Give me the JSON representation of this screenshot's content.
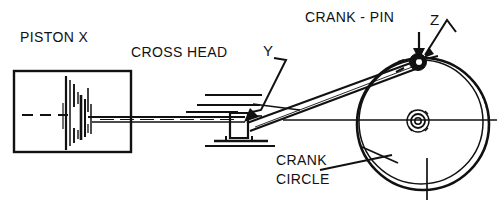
{
  "diagram": {
    "type": "mechanical-line-drawing",
    "stroke_color": "#111111",
    "background_color": "#ffffff",
    "labels": {
      "piston": "PISTON X",
      "cross_head": "CROSS HEAD",
      "crank_pin": "CRANK - PIN",
      "crank_circle_line1": "CRANK",
      "crank_circle_line2": "CIRCLE"
    },
    "pointers": {
      "y": "Y",
      "z": "Z"
    },
    "geometry": {
      "cylinder": {
        "x": 14,
        "y": 71,
        "width": 117,
        "height": 81
      },
      "centerline_y": 114,
      "piston_face_x": 69,
      "piston_rod": {
        "x1": 90,
        "y1": 119,
        "x2": 243,
        "y2": 119
      },
      "cross_head": {
        "x": 222,
        "y": 112,
        "width": 28,
        "height": 28
      },
      "connecting_rod": {
        "x1": 246,
        "y1": 119,
        "x2": 418,
        "y2": 62
      },
      "crank_circle": {
        "cx": 423,
        "cy": 124,
        "r": 66
      },
      "crank_hub": {
        "cx": 418,
        "cy": 121,
        "r": 9
      },
      "crank_pin": {
        "cx": 418,
        "cy": 62,
        "r": 7
      }
    }
  }
}
